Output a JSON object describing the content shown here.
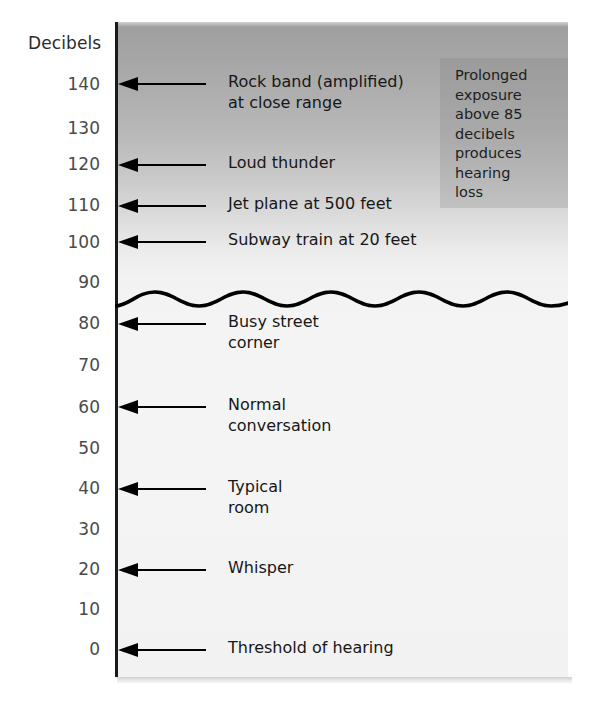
{
  "chart_data": {
    "type": "bar",
    "title": "Decibels",
    "xlabel": "",
    "ylabel": "Decibels",
    "ylim": [
      0,
      145
    ],
    "grid": false,
    "legend": null,
    "axis_title": "Decibels",
    "tick_labels": [
      "140",
      "130",
      "120",
      "110",
      "100",
      "90",
      "80",
      "70",
      "60",
      "50",
      "40",
      "30",
      "20",
      "10",
      "0"
    ],
    "tick_values": [
      140,
      130,
      120,
      110,
      100,
      90,
      80,
      70,
      60,
      50,
      40,
      30,
      20,
      10,
      0
    ],
    "categories": [
      "Rock band (amplified) at close range",
      "Loud thunder",
      "Jet plane at 500 feet",
      "Subway train at 20 feet",
      "Busy street corner",
      "Normal conversation",
      "Typical room",
      "Whisper",
      "Threshold of hearing"
    ],
    "values": [
      140,
      120,
      110,
      100,
      80,
      60,
      40,
      20,
      0
    ],
    "annotations": [
      {
        "text": "Prolonged exposure above 85 decibels produces hearing loss",
        "value": 85
      }
    ],
    "threshold_line": {
      "value": 85,
      "style": "wavy",
      "label": ""
    }
  },
  "axis": {
    "title": "Decibels",
    "ticks": [
      {
        "label": "140",
        "value": 140,
        "top": 75
      },
      {
        "label": "130",
        "value": 130,
        "top": 119
      },
      {
        "label": "120",
        "value": 120,
        "top": 155
      },
      {
        "label": "110",
        "value": 110,
        "top": 196
      },
      {
        "label": "100",
        "value": 100,
        "top": 233
      },
      {
        "label": "90",
        "value": 90,
        "top": 273
      },
      {
        "label": "80",
        "value": 80,
        "top": 314
      },
      {
        "label": "70",
        "value": 70,
        "top": 356
      },
      {
        "label": "60",
        "value": 60,
        "top": 398
      },
      {
        "label": "50",
        "value": 50,
        "top": 439
      },
      {
        "label": "40",
        "value": 40,
        "top": 479
      },
      {
        "label": "30",
        "value": 30,
        "top": 520
      },
      {
        "label": "20",
        "value": 20,
        "top": 560
      },
      {
        "label": "10",
        "value": 10,
        "top": 600
      },
      {
        "label": "0",
        "value": 0,
        "top": 640
      }
    ]
  },
  "sources": [
    {
      "label": "Rock band (amplified)\nat close range",
      "value": 140,
      "arrow_top": 76,
      "label_top": 71
    },
    {
      "label": "Loud thunder",
      "value": 120,
      "arrow_top": 157,
      "label_top": 152
    },
    {
      "label": "Jet plane at 500 feet",
      "value": 110,
      "arrow_top": 198,
      "label_top": 193
    },
    {
      "label": "Subway train at 20 feet",
      "value": 100,
      "arrow_top": 234,
      "label_top": 229
    },
    {
      "label": "Busy street\ncorner",
      "value": 80,
      "arrow_top": 316,
      "label_top": 311
    },
    {
      "label": "Normal\nconversation",
      "value": 60,
      "arrow_top": 399,
      "label_top": 394
    },
    {
      "label": "Typical\nroom",
      "value": 40,
      "arrow_top": 481,
      "label_top": 476
    },
    {
      "label": "Whisper",
      "value": 20,
      "arrow_top": 562,
      "label_top": 557
    },
    {
      "label": "Threshold of hearing",
      "value": 0,
      "arrow_top": 642,
      "label_top": 637
    }
  ],
  "note": {
    "text": "Prolonged\nexposure\nabove 85\ndecibels\nproduces\nhearing\nloss"
  },
  "colors": {
    "panel_top": "#9d9d9d",
    "panel_bottom": "#f2f2f2",
    "axis": "#1a1a1a",
    "arrow": "#000000",
    "tick_text": "#4a4a4a",
    "label_text": "#171717",
    "note_bg": "rgba(120,120,120,0.22)"
  }
}
